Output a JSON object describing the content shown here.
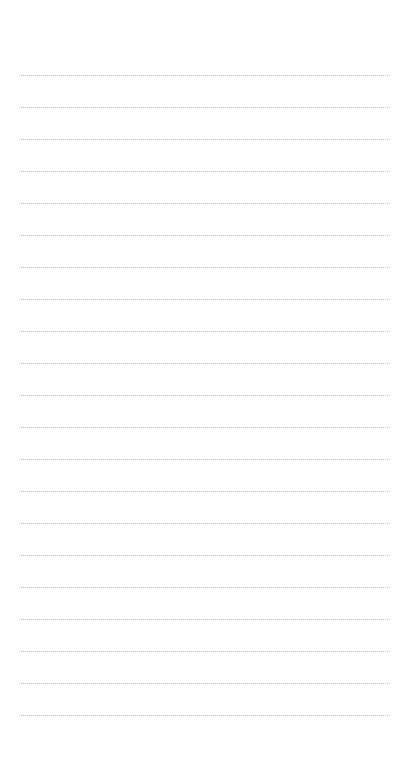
{
  "page": {
    "type": "lined-notepad",
    "background_color": "#ffffff",
    "rule_color": "#b9b9b9",
    "rule_style": "dotted",
    "rule_count": 21,
    "first_rule_y": 75,
    "rule_spacing": 32,
    "rule_left": 19,
    "rule_right": 390
  }
}
